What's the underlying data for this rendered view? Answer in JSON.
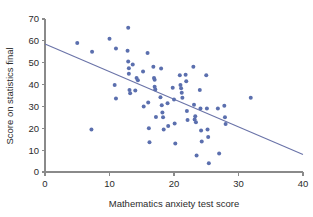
{
  "chart_data": {
    "type": "scatter",
    "title": "",
    "xlabel": "Mathematics anxiety test score",
    "ylabel": "Score on statistics final",
    "xlim": [
      0,
      40
    ],
    "ylim": [
      0,
      70
    ],
    "xticks": [
      0,
      10,
      20,
      30,
      40
    ],
    "yticks": [
      0,
      10,
      20,
      30,
      40,
      50,
      60,
      70
    ],
    "xtick_labels": [
      "0",
      "10",
      "20",
      "30",
      "40"
    ],
    "ytick_labels": [
      "0",
      "10",
      "20",
      "30",
      "40",
      "50",
      "60",
      "70"
    ],
    "grid": false,
    "legend": null,
    "marker_color": "#5b6fae",
    "marker_size": 4.0,
    "trend_line": {
      "type": "linear-regression",
      "color": "#6a73a8",
      "x_start": 0,
      "y_start": 58.5,
      "x_end": 40,
      "y_end": 8.0,
      "slope": -1.2625,
      "intercept": 58.5
    },
    "points": [
      [
        5.0,
        59.0
      ],
      [
        7.3,
        55.0
      ],
      [
        7.2,
        19.5
      ],
      [
        10.0,
        61.0
      ],
      [
        10.8,
        39.8
      ],
      [
        11.0,
        56.5
      ],
      [
        11.0,
        33.6
      ],
      [
        12.8,
        55.5
      ],
      [
        12.9,
        66.0
      ],
      [
        12.9,
        50.5
      ],
      [
        13.0,
        47.5
      ],
      [
        13.0,
        45.0
      ],
      [
        13.1,
        37.5
      ],
      [
        13.2,
        36.0
      ],
      [
        13.6,
        49.2
      ],
      [
        14.0,
        37.3
      ],
      [
        14.2,
        43.0
      ],
      [
        14.4,
        42.0
      ],
      [
        15.2,
        46.0
      ],
      [
        15.3,
        30.0
      ],
      [
        15.9,
        54.5
      ],
      [
        16.0,
        31.8
      ],
      [
        16.1,
        20.0
      ],
      [
        16.2,
        13.6
      ],
      [
        16.8,
        48.2
      ],
      [
        16.9,
        43.0
      ],
      [
        17.0,
        42.2
      ],
      [
        17.0,
        39.0
      ],
      [
        17.1,
        37.8
      ],
      [
        17.2,
        25.2
      ],
      [
        17.9,
        34.2
      ],
      [
        18.0,
        47.3
      ],
      [
        18.1,
        30.5
      ],
      [
        18.2,
        27.2
      ],
      [
        18.3,
        25.0
      ],
      [
        18.4,
        19.5
      ],
      [
        19.0,
        31.5
      ],
      [
        19.1,
        21.0
      ],
      [
        19.8,
        38.5
      ],
      [
        20.0,
        33.2
      ],
      [
        20.1,
        22.2
      ],
      [
        20.2,
        13.0
      ],
      [
        20.9,
        44.3
      ],
      [
        21.0,
        39.8
      ],
      [
        21.1,
        38.3
      ],
      [
        21.2,
        36.3
      ],
      [
        21.3,
        34.0
      ],
      [
        21.8,
        44.5
      ],
      [
        21.9,
        41.5
      ],
      [
        22.0,
        27.9
      ],
      [
        22.1,
        23.8
      ],
      [
        23.0,
        48.2
      ],
      [
        23.1,
        30.8
      ],
      [
        23.2,
        24.0
      ],
      [
        23.3,
        25.5
      ],
      [
        23.4,
        22.8
      ],
      [
        23.5,
        7.5
      ],
      [
        24.0,
        37.5
      ],
      [
        24.1,
        29.0
      ],
      [
        24.2,
        19.0
      ],
      [
        24.3,
        14.0
      ],
      [
        25.0,
        44.3
      ],
      [
        25.1,
        29.0
      ],
      [
        25.2,
        19.5
      ],
      [
        25.3,
        16.0
      ],
      [
        25.4,
        4.0
      ],
      [
        26.8,
        29.0
      ],
      [
        27.0,
        8.5
      ],
      [
        27.8,
        30.3
      ],
      [
        27.9,
        25.0
      ],
      [
        28.0,
        22.0
      ],
      [
        31.9,
        34.0
      ]
    ]
  }
}
